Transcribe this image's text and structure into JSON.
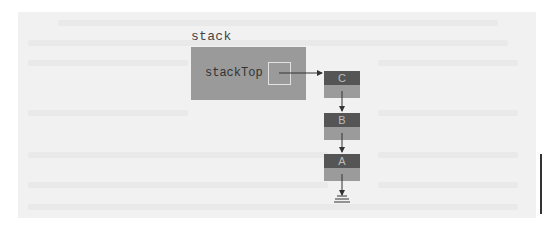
{
  "diagram": {
    "stack_label": "stack",
    "field_label": "stackTop",
    "nodes": [
      {
        "value": "C"
      },
      {
        "value": "B"
      },
      {
        "value": "A"
      }
    ],
    "terminator": "null-ground",
    "colors": {
      "background": "#f1f1f1",
      "stack_box": "#9a9a9a",
      "node_data": "#555555",
      "node_link": "#9b9b9b",
      "arrow": "#333333"
    }
  }
}
